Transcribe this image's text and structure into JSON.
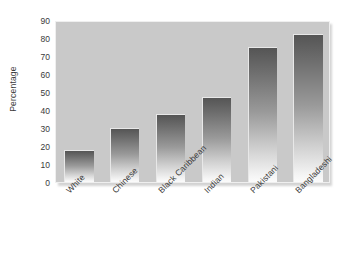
{
  "chart_data": {
    "type": "bar",
    "title": "",
    "subtitle": "",
    "xlabel": "",
    "ylabel": "Percentage",
    "categories": [
      "White",
      "Chinese",
      "Black Caribbean",
      "Indian",
      "Pakistani",
      "Bangladeshi"
    ],
    "values": [
      18,
      30,
      38,
      47,
      75,
      82
    ],
    "ylim": [
      0,
      90
    ],
    "ytick_labels": [
      "0",
      "10",
      "20",
      "30",
      "40",
      "50",
      "60",
      "70",
      "80",
      "90"
    ],
    "ytick_values": [
      0,
      10,
      20,
      30,
      40,
      50,
      60,
      70,
      80,
      90
    ],
    "grid": false,
    "legend": "none",
    "series": [
      {
        "name": "Percentage",
        "values": [
          18,
          30,
          38,
          47,
          75,
          82
        ]
      }
    ],
    "annotations": [],
    "colors": {
      "plot_background": "#c9c9c9",
      "page_background": "#ffffff",
      "bar_gradient_top": "#555555",
      "bar_gradient_bottom": "#fbfbfb",
      "axis_text": "#3a3a3a",
      "plot_border": "#efefef"
    },
    "xtick_rotation": -45
  }
}
